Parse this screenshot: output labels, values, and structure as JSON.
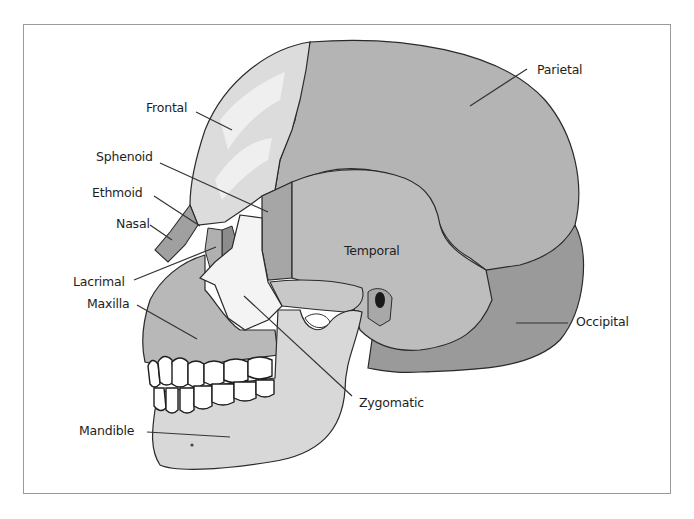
{
  "diagram": {
    "labels": {
      "frontal": "Frontal",
      "parietal": "Parietal",
      "sphenoid": "Sphenoid",
      "ethmoid": "Ethmoid",
      "nasal": "Nasal",
      "temporal": "Temporal",
      "lacrimal": "Lacrimal",
      "maxilla": "Maxilla",
      "occipital": "Occipital",
      "zygomatic": "Zygomatic",
      "mandible": "Mandible"
    },
    "colors": {
      "frame_border": "#9a9a9a",
      "outline": "#2a2a2a",
      "parietal": "#b4b4b4",
      "frontal": "#dcdcdc",
      "frontal_highlight": "#efefef",
      "temporal": "#bdbdbd",
      "occipital": "#9a9a9a",
      "sphenoid": "#a6a6a6",
      "zygomatic": "#f4f4f4",
      "maxilla": "#b8b8b8",
      "mandible": "#d8d8d8",
      "teeth": "#ffffff",
      "nasal": "#a0a0a0",
      "lacrimal": "#b0b0b0",
      "ethmoid": "#8c8c8c",
      "label_text": "#1e1e1e"
    }
  }
}
